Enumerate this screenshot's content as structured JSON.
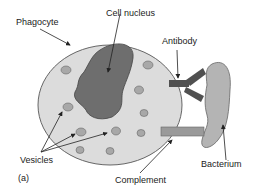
{
  "diagram": {
    "panel_label": "(a)",
    "labels": {
      "phagocyte": "Phagocyte",
      "cell_nucleus": "Cell nucleus",
      "antibody": "Antibody",
      "vesicles": "Vesicles",
      "bacterium": "Bacterium",
      "complement": "Complement"
    },
    "colors": {
      "cell_fill": "#dcdcdc",
      "nucleus_fill": "#6e6e6e",
      "vesicle_fill": "#a8a8a8",
      "bacterium_fill": "#b4b4b4",
      "antibody_fill": "#505050",
      "complement_fill": "#9a9a9a",
      "outline": "#555555"
    }
  }
}
